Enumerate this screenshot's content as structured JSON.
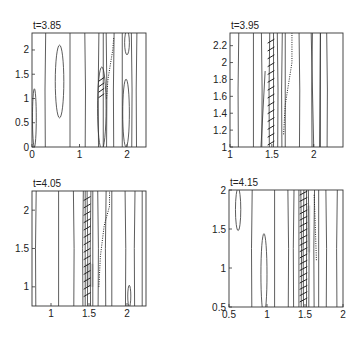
{
  "chart_data": [
    {
      "type": "contour",
      "title": "t=3.85",
      "xlim": [
        0,
        2.4
      ],
      "ylim": [
        0,
        2.35
      ],
      "xticks": [
        0,
        1,
        2
      ],
      "xtick_labels": [
        "0",
        "1",
        "2"
      ],
      "yticks": [
        0,
        0.5,
        1,
        1.5,
        2
      ],
      "ytick_labels": [
        "0",
        "0.5",
        "1",
        "1.5",
        "2"
      ],
      "grid": false,
      "box": {
        "left": 32,
        "top": 33,
        "right": 146,
        "bottom": 147
      },
      "vertical_contours_x": [
        0.28,
        0.8,
        1.12,
        1.4,
        1.5,
        1.57,
        1.72,
        1.9,
        2.1,
        2.2
      ],
      "closed_contours": [
        {
          "cx": 0.58,
          "cy": 1.35,
          "rx": 0.09,
          "ry": 0.75
        },
        {
          "cx": 0.05,
          "cy": 0.6,
          "rx": 0.04,
          "ry": 0.6
        },
        {
          "cx": 1.98,
          "cy": 0.7,
          "rx": 0.07,
          "ry": 0.7
        },
        {
          "cx": 2.0,
          "cy": 2.15,
          "rx": 0.05,
          "ry": 0.25
        },
        {
          "cx": 1.47,
          "cy": 0.8,
          "rx": 0.09,
          "ry": 0.85
        }
      ],
      "dotted_front": [
        [
          1.57,
          1.0
        ],
        [
          1.6,
          1.4
        ],
        [
          1.65,
          1.7
        ],
        [
          1.7,
          2.0
        ],
        [
          1.72,
          2.25
        ]
      ],
      "hatch_region": {
        "x0": 1.4,
        "x1": 1.52,
        "y0": 1.0,
        "y1": 1.45,
        "count": 4
      }
    },
    {
      "type": "contour",
      "title": "t=3.95",
      "xlim": [
        1,
        2.35
      ],
      "ylim": [
        1,
        2.35
      ],
      "xticks": [
        1,
        1.5,
        2
      ],
      "xtick_labels": [
        "1",
        "1.5",
        "2"
      ],
      "yticks": [
        1,
        1.2,
        1.4,
        1.6,
        1.8,
        2,
        2.2
      ],
      "ytick_labels": [
        "1",
        "1.2",
        "1.4",
        "1.6",
        "1.8",
        "2",
        "2.2"
      ],
      "grid": false,
      "box": {
        "left": 230,
        "top": 33,
        "right": 343,
        "bottom": 147
      },
      "vertical_contours_x": [
        1.1,
        1.28,
        1.38,
        1.47,
        1.52,
        1.57,
        1.62,
        1.66,
        1.83,
        1.98,
        2.08,
        2.16
      ],
      "slanted_contours": [
        [
          [
            1.37,
            1.0
          ],
          [
            1.42,
            1.9
          ]
        ],
        [
          [
            2.0,
            1.0
          ],
          [
            1.97,
            2.35
          ]
        ],
        [
          [
            2.07,
            1.0
          ],
          [
            2.08,
            2.35
          ]
        ]
      ],
      "dotted_front": [
        [
          1.64,
          1.15
        ],
        [
          1.66,
          1.5
        ],
        [
          1.7,
          1.75
        ],
        [
          1.74,
          2.0
        ],
        [
          1.74,
          2.35
        ]
      ],
      "hatch_region": {
        "x0": 1.45,
        "x1": 1.53,
        "y0": 1.0,
        "y1": 2.3,
        "count": 14
      }
    },
    {
      "type": "contour",
      "title": "t=4.05",
      "xlim": [
        0.75,
        2.25
      ],
      "ylim": [
        0.75,
        2.25
      ],
      "xticks": [
        1,
        1.5,
        2
      ],
      "xtick_labels": [
        "1",
        "1.5",
        "2"
      ],
      "yticks": [
        1,
        1.5,
        2
      ],
      "ytick_labels": [
        "1",
        "1.5",
        "2"
      ],
      "grid": false,
      "box": {
        "left": 32,
        "top": 191,
        "right": 146,
        "bottom": 306
      },
      "vertical_contours_x": [
        0.8,
        1.1,
        1.3,
        1.42,
        1.45,
        1.48,
        1.52,
        1.55,
        1.62,
        1.72,
        1.8,
        1.98,
        2.1,
        2.2
      ],
      "closed_contours": [
        {
          "cx": 2.03,
          "cy": 0.88,
          "rx": 0.02,
          "ry": 0.14
        }
      ],
      "dotted_front": [
        [
          1.63,
          1.0
        ],
        [
          1.65,
          1.4
        ],
        [
          1.7,
          1.8
        ],
        [
          1.77,
          2.05
        ],
        [
          1.77,
          2.25
        ]
      ],
      "hatch_region": {
        "x0": 1.43,
        "x1": 1.52,
        "y0": 0.85,
        "y1": 2.2,
        "count": 14
      },
      "shade_region": {
        "x0": 1.45,
        "x1": 1.56,
        "y0": 1.0,
        "y1": 1.3
      }
    },
    {
      "type": "contour",
      "title": "t=4.15",
      "xlim": [
        0.5,
        2
      ],
      "ylim": [
        0.5,
        2
      ],
      "xticks": [
        0.5,
        1,
        1.5,
        2
      ],
      "xtick_labels": [
        "0.5",
        "1",
        "1.5",
        "2"
      ],
      "yticks": [
        0.5,
        1,
        1.5,
        2
      ],
      "ytick_labels": [
        "0.5",
        "1",
        "1.5",
        "2"
      ],
      "grid": false,
      "box": {
        "left": 229,
        "top": 190,
        "right": 343,
        "bottom": 307
      },
      "vertical_contours_x": [
        0.8,
        1.1,
        1.28,
        1.35,
        1.42,
        1.45,
        1.48,
        1.52,
        1.55,
        1.62,
        1.68,
        1.78,
        1.92
      ],
      "closed_contours": [
        {
          "cx": 0.62,
          "cy": 1.75,
          "rx": 0.035,
          "ry": 0.27
        },
        {
          "cx": 0.96,
          "cy": 0.92,
          "rx": 0.04,
          "ry": 0.52
        }
      ],
      "dotted_front": [
        [
          1.65,
          1.1
        ],
        [
          1.64,
          1.4
        ],
        [
          1.63,
          1.7
        ],
        [
          1.62,
          1.95
        ]
      ],
      "hatch_region": {
        "x0": 1.43,
        "x1": 1.53,
        "y0": 0.55,
        "y1": 2.0,
        "count": 18
      },
      "shade_region": {
        "x0": 1.52,
        "x1": 1.57,
        "y0": 1.2,
        "y1": 1.8
      }
    }
  ]
}
